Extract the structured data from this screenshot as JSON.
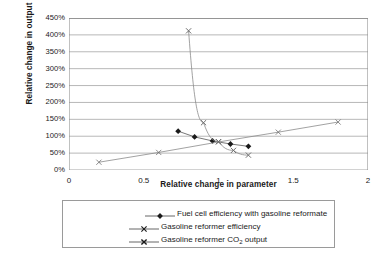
{
  "chart_data": {
    "type": "scatter",
    "title": "",
    "xlabel": "Relative change in parameter",
    "ylabel": "Relative change in output",
    "xlim": [
      0,
      2
    ],
    "ylim": [
      0,
      4.5
    ],
    "x_ticks": [
      "0",
      "0.5",
      "1",
      "1.5",
      "2"
    ],
    "x_tick_values": [
      0,
      0.5,
      1,
      1.5,
      2
    ],
    "y_ticks": [
      "0%",
      "50%",
      "100%",
      "150%",
      "200%",
      "250%",
      "300%",
      "350%",
      "400%",
      "450%"
    ],
    "y_tick_values": [
      0,
      0.5,
      1.0,
      1.5,
      2.0,
      2.5,
      3.0,
      3.5,
      4.0,
      4.5
    ],
    "grid": "horizontal",
    "legend_position": "bottom",
    "series": [
      {
        "name": "Fuel cell efficiency with gasoline reformate",
        "marker": "filled-diamond",
        "color": "#1a1a1a",
        "x": [
          0.73,
          0.84,
          0.96,
          1.08,
          1.2
        ],
        "y": [
          1.15,
          0.98,
          0.86,
          0.77,
          0.7
        ]
      },
      {
        "name": "Gasoline reformer efficiency",
        "marker": "x-thin",
        "color": "#6e6e6e",
        "x": [
          0.2,
          0.6,
          1.0,
          1.4,
          1.8
        ],
        "y": [
          0.23,
          0.52,
          0.83,
          1.12,
          1.42
        ]
      },
      {
        "name": "Gasoline reformer CO2 output",
        "marker": "x-bold",
        "color": "#6e6e6e",
        "x": [
          0.8,
          0.9,
          1.0,
          1.1,
          1.2
        ],
        "y": [
          4.12,
          1.4,
          0.84,
          0.58,
          0.44
        ]
      }
    ]
  },
  "legend": {
    "items": [
      {
        "label_pre": "Fuel cell efficiency with gasoline reformate",
        "label_sub": "",
        "label_post": ""
      },
      {
        "label_pre": "Gasoline reformer efficiency",
        "label_sub": "",
        "label_post": ""
      },
      {
        "label_pre": "Gasoline reformer CO",
        "label_sub": "2",
        "label_post": " output"
      }
    ]
  },
  "colors": {
    "axis": "#8c8c8c",
    "grid": "#9a9a9a",
    "series_dark": "#1a1a1a",
    "series_gray": "#6e6e6e",
    "text": "#1a1a1a",
    "background": "#ffffff"
  }
}
